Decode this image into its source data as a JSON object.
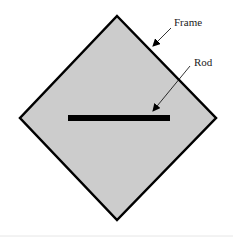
{
  "diagram": {
    "labels": {
      "frame": "Frame",
      "rod": "Rod"
    },
    "colors": {
      "frame_fill": "#cccccc",
      "frame_stroke": "#000000",
      "rod": "#000000",
      "background": "#ffffff"
    }
  }
}
